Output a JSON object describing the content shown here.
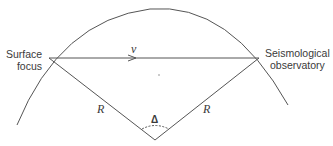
{
  "diagram": {
    "type": "seismic-geometry",
    "labels": {
      "surface_focus": [
        "Surface",
        "focus"
      ],
      "observatory": [
        "Seismological",
        "observatory"
      ],
      "velocity": "v",
      "radius_left": "R",
      "radius_right": "R",
      "angle": "Δ"
    },
    "colors": {
      "line": "#555555",
      "text": "#3a3a3a",
      "background": "#ffffff"
    },
    "points": {
      "surface_focus": [
        49,
        58
      ],
      "observatory": [
        259,
        58
      ],
      "earth_center": [
        155,
        140
      ]
    }
  }
}
